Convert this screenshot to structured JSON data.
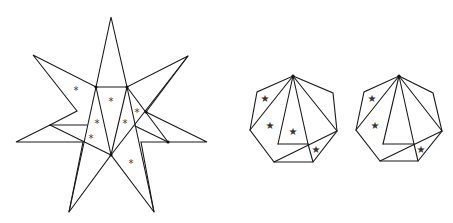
{
  "figure": {
    "stroke_color": "#1a1a1a",
    "star_figure": {
      "outline": [
        [
          111,
          17
        ],
        [
          127,
          87
        ],
        [
          188,
          56
        ],
        [
          146,
          112
        ],
        [
          207,
          142
        ],
        [
          141,
          142
        ],
        [
          154,
          212
        ],
        [
          111,
          155
        ],
        [
          69,
          212
        ],
        [
          83,
          142
        ],
        [
          16,
          142
        ],
        [
          50,
          125
        ],
        [
          77,
          111
        ],
        [
          33,
          55
        ],
        [
          96,
          87
        ]
      ],
      "segments": [
        [
          [
            96,
            87
          ],
          [
            127,
            87
          ]
        ],
        [
          [
            96,
            87
          ],
          [
            111,
            155
          ]
        ],
        [
          [
            127,
            87
          ],
          [
            111,
            155
          ]
        ],
        [
          [
            96,
            87
          ],
          [
            69,
            212
          ]
        ],
        [
          [
            127,
            87
          ],
          [
            154,
            212
          ]
        ],
        [
          [
            50,
            125
          ],
          [
            87,
            125
          ]
        ],
        [
          [
            50,
            125
          ],
          [
            111,
            155
          ]
        ],
        [
          [
            188,
            56
          ],
          [
            111,
            155
          ]
        ],
        [
          [
            127,
            87
          ],
          [
            168,
            142
          ]
        ],
        [
          [
            135,
            126
          ],
          [
            168,
            142
          ]
        ]
      ],
      "dots": [
        [
          111,
          155
        ],
        [
          127,
          87
        ],
        [
          96,
          87
        ],
        [
          146,
          112
        ],
        [
          168,
          142
        ]
      ],
      "marker": "*",
      "markers": [
        [
          76,
          90
        ],
        [
          111,
          101
        ],
        [
          97,
          123
        ],
        [
          125,
          123
        ],
        [
          137,
          112
        ],
        [
          91,
          138
        ],
        [
          131,
          163
        ]
      ]
    },
    "heptagon_1": {
      "outline": [
        [
          293,
          76
        ],
        [
          333,
          93
        ],
        [
          337,
          131
        ],
        [
          313,
          162
        ],
        [
          274,
          162
        ],
        [
          250,
          130
        ],
        [
          257,
          92
        ]
      ],
      "segments": [
        [
          [
            293,
            76
          ],
          [
            250,
            130
          ]
        ],
        [
          [
            293,
            76
          ],
          [
            278,
            144
          ]
        ],
        [
          [
            278,
            144
          ],
          [
            308,
            144
          ]
        ],
        [
          [
            293,
            76
          ],
          [
            308,
            144
          ]
        ],
        [
          [
            308,
            144
          ],
          [
            313,
            162
          ]
        ],
        [
          [
            293,
            76
          ],
          [
            337,
            131
          ]
        ],
        [
          [
            337,
            131
          ],
          [
            274,
            162
          ]
        ]
      ],
      "dots": [
        [
          293,
          76
        ]
      ],
      "marker": "★",
      "markers": [
        [
          265,
          98
        ],
        [
          270,
          125
        ],
        [
          293,
          131
        ],
        [
          316,
          149
        ]
      ]
    },
    "heptagon_2": {
      "outline": [
        [
          399,
          76
        ],
        [
          433,
          93
        ],
        [
          442,
          131
        ],
        [
          418,
          161
        ],
        [
          380,
          161
        ],
        [
          356,
          130
        ],
        [
          364,
          92
        ]
      ],
      "segments": [
        [
          [
            399,
            76
          ],
          [
            356,
            130
          ]
        ],
        [
          [
            399,
            76
          ],
          [
            383,
            144
          ]
        ],
        [
          [
            383,
            144
          ],
          [
            414,
            144
          ]
        ],
        [
          [
            399,
            76
          ],
          [
            414,
            144
          ]
        ],
        [
          [
            414,
            144
          ],
          [
            418,
            161
          ]
        ],
        [
          [
            399,
            76
          ],
          [
            442,
            131
          ]
        ],
        [
          [
            442,
            131
          ],
          [
            380,
            161
          ]
        ]
      ],
      "dots": [
        [
          399,
          76
        ]
      ],
      "marker": "★",
      "markers": [
        [
          372,
          98
        ],
        [
          375,
          125
        ],
        [
          421,
          149
        ]
      ]
    }
  }
}
